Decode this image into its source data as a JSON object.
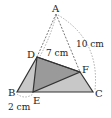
{
  "diagram": {
    "type": "geometry",
    "points": {
      "A": {
        "label": "A",
        "x": 56,
        "y": 14
      },
      "B": {
        "label": "B",
        "x": 17,
        "y": 92
      },
      "C": {
        "label": "C",
        "x": 93,
        "y": 92
      },
      "D": {
        "label": "D",
        "x": 37,
        "y": 57
      },
      "E": {
        "label": "E",
        "x": 33,
        "y": 92
      },
      "F": {
        "label": "F",
        "x": 80,
        "y": 72
      }
    },
    "measurements": {
      "AD": "7 cm",
      "AC": "10 cm",
      "BE": "2 cm"
    },
    "colors": {
      "triangle_fill": "#c8c8c8",
      "folded_fill": "#9a9a9a",
      "stroke": "#333333",
      "dashed": "#555555"
    }
  }
}
